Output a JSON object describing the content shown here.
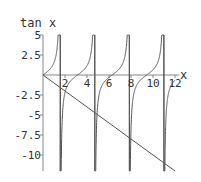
{
  "chart_data": {
    "type": "line",
    "title": "",
    "xlabel": "x",
    "ylabel": "tan x",
    "xlim": [
      0,
      12.4
    ],
    "ylim": [
      -12,
      5
    ],
    "x_ticks": [
      2,
      4,
      6,
      8,
      10,
      12
    ],
    "x_tick_labels": [
      "2",
      "4",
      "6",
      "8",
      "10",
      "12"
    ],
    "y_ticks": [
      5,
      2.5,
      -2.5,
      -5,
      -7.5,
      -10
    ],
    "y_tick_labels": [
      "5",
      "2.5",
      "-2.5",
      "-5",
      "-7.5",
      "-10"
    ],
    "grid": false,
    "legend": null,
    "series": [
      {
        "name": "tan x",
        "function": "tan(x)",
        "domain": [
          0,
          12
        ],
        "asymptotes": [
          1.5708,
          4.7124,
          7.854,
          10.9956
        ]
      },
      {
        "name": "-x",
        "function": "-x",
        "domain": [
          0,
          12
        ],
        "points": [
          [
            0,
            0
          ],
          [
            12,
            -12
          ]
        ]
      }
    ],
    "colors": {
      "curve": "#555555",
      "axis": "#888888",
      "text": "#333333"
    }
  }
}
